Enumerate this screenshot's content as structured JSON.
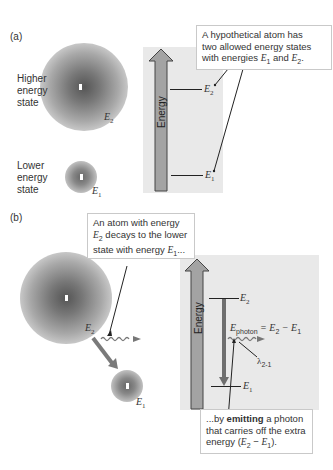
{
  "panel_a": {
    "label": "(a)",
    "higher_state_label": [
      "Higher",
      "energy",
      "state"
    ],
    "lower_state_label": [
      "Lower",
      "energy",
      "state"
    ],
    "e2_label": "E",
    "e2_sub": "2",
    "e1_label": "E",
    "e1_sub": "1",
    "energy_axis_label": "Energy",
    "level_e2": "E",
    "level_e2_sub": "2",
    "level_e1": "E",
    "level_e1_sub": "1",
    "callout": {
      "line1": "A hypothetical atom has",
      "line2": "two allowed energy states",
      "line3_prefix": "with energies ",
      "line3_e1": "E",
      "line3_e1_sub": "1",
      "line3_and": " and ",
      "line3_e2": "E",
      "line3_e2_sub": "2",
      "line3_suffix": "."
    }
  },
  "panel_b": {
    "label": "(b)",
    "e2_label": "E",
    "e2_sub": "2",
    "e1_label": "E",
    "e1_sub": "1",
    "energy_axis_label": "Energy",
    "level_e2": "E",
    "level_e2_sub": "2",
    "level_e1": "E",
    "level_e1_sub": "1",
    "photon_eq": {
      "e": "E",
      "sub": "photon",
      "rest": " = E",
      "rest_sub2": "2",
      "minus": " − E",
      "rest_sub1": "1"
    },
    "wavelength_label": "λ",
    "wavelength_sub": "2-1",
    "callout_top": {
      "line1": "An atom with energy",
      "line2_e": "E",
      "line2_sub": "2",
      "line2_rest": " decays to the lower",
      "line3_prefix": "state with energy ",
      "line3_e": "E",
      "line3_sub": "1",
      "line3_suffix": "..."
    },
    "callout_bottom": {
      "line1_prefix": "...by ",
      "line1_bold": "emitting",
      "line1_suffix": " a photon",
      "line2": "that carries off the extra",
      "line3_prefix": "energy (",
      "line3_e2": "E",
      "line3_e2_sub": "2",
      "line3_minus": " − ",
      "line3_e1": "E",
      "line3_e1_sub": "1",
      "line3_suffix": ")."
    }
  },
  "colors": {
    "panel_bg": "#e9e9e9",
    "arrow_gray": "#8a8a8a",
    "line": "#222222"
  }
}
